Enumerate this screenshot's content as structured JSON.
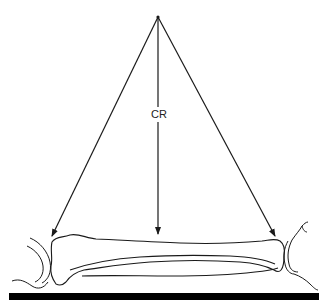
{
  "diagram": {
    "title": "",
    "labels": {
      "central_ray": "CR"
    },
    "elements": [
      {
        "id": "tube-focal-point",
        "type": "point",
        "x": 158,
        "y": 17
      },
      {
        "id": "left-ray",
        "type": "arrow",
        "from": [
          158,
          17
        ],
        "to": [
          52,
          236
        ]
      },
      {
        "id": "central-ray",
        "type": "arrow",
        "from": [
          158,
          17
        ],
        "to": [
          160,
          235
        ],
        "label": "CR"
      },
      {
        "id": "right-ray",
        "type": "arrow",
        "from": [
          158,
          17
        ],
        "to": [
          275,
          236
        ]
      },
      {
        "id": "long-bone",
        "type": "bone-outline"
      },
      {
        "id": "proximal-joint",
        "type": "joint-outline"
      },
      {
        "id": "distal-joint",
        "type": "joint-outline"
      },
      {
        "id": "image-receptor",
        "type": "bar",
        "x": 9,
        "y": 293,
        "width": 310,
        "height": 7
      }
    ],
    "colors": {
      "line": "#1a1a1a",
      "receptor": "#000000",
      "background": "#ffffff"
    }
  }
}
